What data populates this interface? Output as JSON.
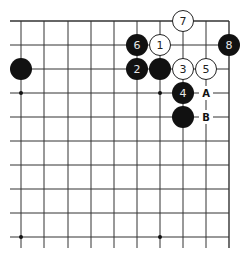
{
  "diagram": {
    "type": "go-board-partial",
    "grid": {
      "columns": 10,
      "rows": 10,
      "x_lines": [
        21,
        44,
        68,
        91,
        114,
        137,
        160,
        183,
        206,
        229
      ],
      "y_lines": [
        21,
        45,
        69,
        93,
        117,
        141,
        165,
        189,
        213,
        237
      ],
      "edges": {
        "top": true,
        "right": true,
        "left": false,
        "bottom": false
      },
      "line_color": "#333333"
    },
    "star_points": [
      {
        "col": 0,
        "row": 3
      },
      {
        "col": 6,
        "row": 3
      },
      {
        "col": 0,
        "row": 9
      },
      {
        "col": 6,
        "row": 9
      }
    ],
    "stones": [
      {
        "color": "black",
        "col": 0,
        "row": 2,
        "label": ""
      },
      {
        "color": "white",
        "col": 6,
        "row": 1,
        "label": "1"
      },
      {
        "color": "black",
        "col": 5,
        "row": 2,
        "label": "2"
      },
      {
        "color": "black",
        "col": 6,
        "row": 2,
        "label": ""
      },
      {
        "color": "white",
        "col": 7,
        "row": 2,
        "label": "3"
      },
      {
        "color": "black",
        "col": 7,
        "row": 3,
        "label": "4"
      },
      {
        "color": "white",
        "col": 8,
        "row": 2,
        "label": "5"
      },
      {
        "color": "black",
        "col": 5,
        "row": 1,
        "label": "6"
      },
      {
        "color": "white",
        "col": 7,
        "row": 0,
        "label": "7"
      },
      {
        "color": "black",
        "col": 9,
        "row": 1,
        "label": "8"
      },
      {
        "color": "black",
        "col": 7,
        "row": 4,
        "label": ""
      }
    ],
    "markers": [
      {
        "col": 8,
        "row": 3,
        "label": "A"
      },
      {
        "col": 8,
        "row": 4,
        "label": "B"
      }
    ]
  }
}
